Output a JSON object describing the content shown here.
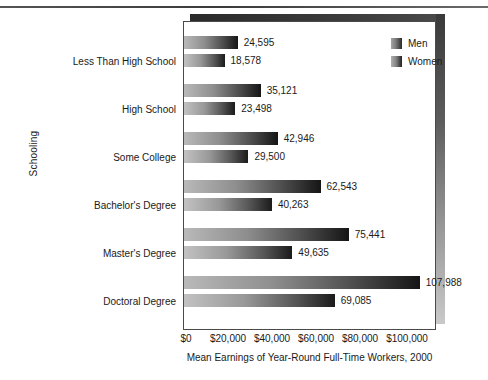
{
  "chart_data": {
    "type": "bar",
    "orientation": "horizontal",
    "title": "",
    "xlabel": "Mean Earnings of Year-Round Full-Time Workers, 2000",
    "ylabel": "Schooling",
    "categories": [
      "Less Than High School",
      "High School",
      "Some College",
      "Bachelor's Degree",
      "Master's Degree",
      "Doctoral Degree"
    ],
    "series": [
      {
        "name": "Men",
        "values": [
          24595,
          35121,
          42946,
          62543,
          75441,
          107988
        ],
        "labels": [
          "24,595",
          "35,121",
          "42,946",
          "62,543",
          "75,441",
          "107,988"
        ]
      },
      {
        "name": "Women",
        "values": [
          18578,
          23498,
          29500,
          40263,
          49635,
          69085
        ],
        "labels": [
          "18,578",
          "23,498",
          "29,500",
          "40,263",
          "49,635",
          "69,085"
        ]
      }
    ],
    "xlim": [
      0,
      115000
    ],
    "xticks": [
      0,
      20000,
      40000,
      60000,
      80000,
      100000
    ],
    "xtick_labels": [
      "$0",
      "$20,000",
      "$40,000",
      "$60,000",
      "$80,000",
      "$100,000"
    ],
    "grid": false,
    "legend_position": "top-right",
    "legend_entries": [
      "Men",
      "Women"
    ],
    "colors": {
      "bar_light": "#b9b9b9",
      "bar_dark": "#151515",
      "frame": "#4a4a4a",
      "text": "#1a1a1a",
      "background": "#ffffff"
    }
  }
}
